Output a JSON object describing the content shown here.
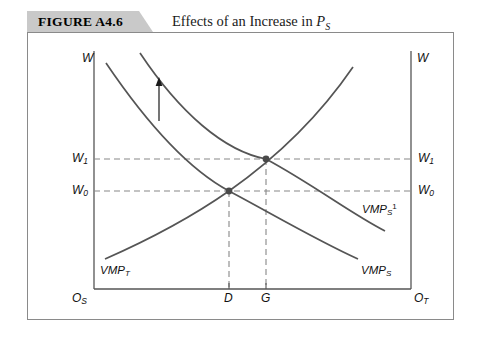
{
  "figure": {
    "tag": "FIGURE A4.6",
    "title_prefix": "Effects of an Increase in ",
    "title_symbol": "P",
    "title_symbol_sub": "S"
  },
  "axes": {
    "left_top_label": "W",
    "right_top_label": "W",
    "origin_left": "O",
    "origin_left_sub": "S",
    "origin_right": "O",
    "origin_right_sub": "T"
  },
  "wage_levels": [
    {
      "name": "W",
      "sub": "1",
      "y": 158
    },
    {
      "name": "W",
      "sub": "0",
      "y": 190
    }
  ],
  "quantity_ticks": [
    {
      "label": "D",
      "x": 228
    },
    {
      "label": "G",
      "x": 265
    }
  ],
  "curves": [
    {
      "id": "vmp-t",
      "label": "VMP",
      "label_sub": "T",
      "label_sup": "",
      "direction": "upward-sloping",
      "path": "M 104 258 C 150 238, 200 214, 240 184 C 285 150, 330 110, 368 62"
    },
    {
      "id": "vmp-s",
      "label": "VMP",
      "label_sub": "S",
      "label_sup": "",
      "direction": "downward-sloping",
      "path": "M 105 62 C 150 122, 195 166, 240 196 C 285 226, 330 248, 372 261"
    },
    {
      "id": "vmp-s-1",
      "label": "VMP",
      "label_sub": "S",
      "label_sup": "1",
      "direction": "downward-sloping-shifted",
      "path": "M 139 52 C 182 110, 228 152, 272 180 C 316 208, 352 222, 389 231"
    }
  ],
  "equilibria": [
    {
      "id": "initial",
      "x": 228,
      "y": 190,
      "wage": "W0",
      "quantity": "D"
    },
    {
      "id": "new",
      "x": 265,
      "y": 158,
      "wage": "W1",
      "quantity": "G"
    }
  ],
  "shift_arrow": {
    "name": "upward-shift-arrow",
    "x": 158,
    "y_from": 120,
    "y_to": 79
  },
  "colors": {
    "tag_background": "#c9c9c9",
    "frame_border": "#8a8a8a",
    "curve": "#555555",
    "axis": "#555555",
    "dashed": "#888888",
    "text": "#111111"
  }
}
